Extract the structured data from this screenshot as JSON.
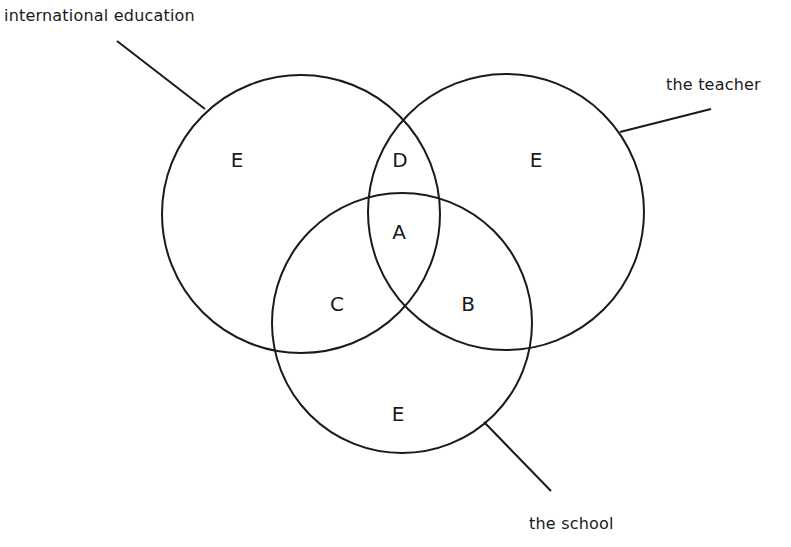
{
  "diagram": {
    "type": "venn",
    "sets": [
      {
        "id": "international_education",
        "label": "international education"
      },
      {
        "id": "teacher",
        "label": "the teacher"
      },
      {
        "id": "school",
        "label": "the school"
      }
    ],
    "regions": {
      "e_left": "E",
      "d": "D",
      "e_right": "E",
      "a": "A",
      "c": "C",
      "b": "B",
      "e_bottom": "E"
    },
    "colors": {
      "stroke": "#1a1a1a",
      "background": "#ffffff"
    }
  }
}
